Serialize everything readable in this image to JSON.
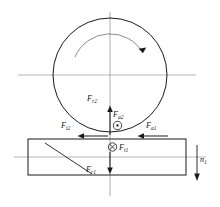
{
  "figure": {
    "type": "mechanical-force-diagram",
    "background_color": "#ffffff",
    "line_color": "#1a1a1a",
    "center_line_color": "#9a9a9a"
  },
  "labels": {
    "f_r2": {
      "base": "F",
      "sub": "r2"
    },
    "f_a2": {
      "base": "F",
      "sub": "a2"
    },
    "f_t2": {
      "base": "F",
      "sub": "t2"
    },
    "f_a1": {
      "base": "F",
      "sub": "a1"
    },
    "f_t1": {
      "base": "F",
      "sub": "t1"
    },
    "f_r1": {
      "base": "F",
      "sub": "r1"
    },
    "n_1": {
      "base": "n",
      "sub": "1"
    }
  },
  "symbols": {
    "out_of_page": "circled-dot",
    "into_page": "circled-cross",
    "rotation": "curved-arrow-clockwise",
    "speed_direction": "down-arrow"
  },
  "geometry": {
    "gear_circle": {
      "cx": 110,
      "cy": 75,
      "r": 57
    },
    "rotation_arc_radius": 38,
    "rectangle": {
      "x": 28,
      "y": 139,
      "width": 158,
      "height": 36
    },
    "horizontal_axis_gear_y": 75,
    "horizontal_axis_shaft_y": 157,
    "vertical_axis_x": 110,
    "diagonal_line": {
      "x1": 45,
      "y1": 143,
      "x2": 92,
      "y2": 174
    }
  }
}
